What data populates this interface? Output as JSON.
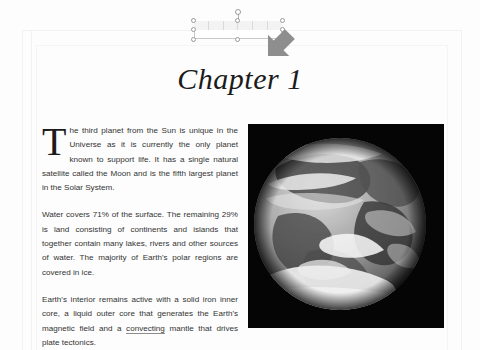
{
  "document": {
    "heading": "Chapter 1",
    "paragraphs": [
      {
        "id": "para-1",
        "drop_cap": "T",
        "text": "he third planet from the Sun is unique in the Universe as it is currently the only planet known to support life. It has a single natural satellite called the Moon and is the fifth largest planet in the Solar System."
      },
      {
        "id": "para-2",
        "text": "Water covers 71% of the surface. The remaining 29% is land consisting of continents and islands that together contain many lakes, rivers and other sources of water. The majority of Earth's polar regions are covered in ice."
      },
      {
        "id": "para-3",
        "text_before_misspelling": "Earth's interior remains active with a solid iron inner core, a liquid outer core that generates the Earth's magnetic field and a ",
        "misspelled_word": "convecting",
        "text_after_misspelling": " mantle that drives plate tectonics."
      }
    ]
  },
  "figure": {
    "name": "earth-photograph",
    "alt": "Grayscale photograph of planet Earth on a black background",
    "background_color": "#050505"
  },
  "selection": {
    "object_name": "table-shape",
    "cell_count": 6,
    "handle_count": 8,
    "rotate_handle": "rotation-handle",
    "border_color": "#c9c9c9",
    "handle_fill": "#ffffff",
    "handle_stroke": "#9a9a9a"
  },
  "cursor": {
    "type": "arrow-pointer",
    "color": "#8e8e8e",
    "x": 261,
    "y": 27
  },
  "colors": {
    "page_background": "#fdfdfd",
    "body_text": "#333333",
    "heading_text": "#1b1b1b",
    "guide_line": "#f2f2f2"
  }
}
